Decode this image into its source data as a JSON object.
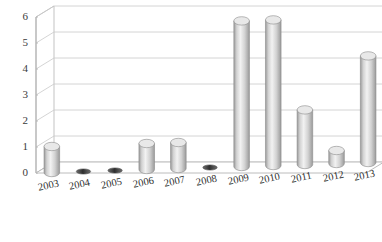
{
  "chart_data": {
    "type": "bar",
    "title": "",
    "subtitle": "",
    "xlabel": "",
    "ylabel": "",
    "categories": [
      "2003",
      "2004",
      "2005",
      "2006",
      "2007",
      "2008",
      "2009",
      "2010",
      "2011",
      "2012",
      "2013"
    ],
    "values": [
      1,
      0,
      0,
      1,
      1,
      0,
      5.6,
      5.6,
      2.1,
      0.5,
      4.1
    ],
    "series": [
      {
        "name": "",
        "values": [
          1,
          0,
          0,
          1,
          1,
          0,
          5.6,
          5.6,
          2.1,
          0.5,
          4.1
        ]
      }
    ],
    "ylim": [
      0,
      6
    ],
    "ytick_labels": [
      "0",
      "1",
      "2",
      "3",
      "4",
      "5",
      "6"
    ],
    "ytick_values": [
      0,
      1,
      2,
      3,
      4,
      5,
      6
    ],
    "grid": true,
    "legend": false,
    "legend_position": "none",
    "style": "3d-cylinder",
    "annotations": []
  },
  "colors": {
    "bar_light": "#f2f2f2",
    "bar_mid": "#d2d2d2",
    "bar_dark": "#9a9a9a",
    "bar_edge": "#8c8c8c",
    "bar_top": "#e8e8e8",
    "zero_marker": "#4a4a4a",
    "grid_line": "#c9c9c9",
    "axis_line": "#b4b4b4",
    "floor": "#ffffff",
    "tick_text": "#3a3a3a",
    "background": "#ffffff"
  }
}
